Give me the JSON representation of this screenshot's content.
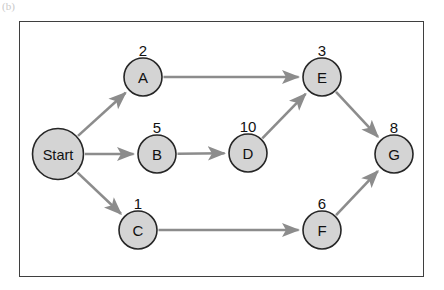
{
  "figure": {
    "corner_mark": "(b)",
    "frame": {
      "x": 19,
      "y": 21,
      "width": 405,
      "height": 256,
      "border_color": "#3f3f3f"
    }
  },
  "colors": {
    "node_fill": "#d4d4d4",
    "node_stroke": "#262626",
    "edge": "#8c8c8c",
    "text": "#111111",
    "background": "#ffffff"
  },
  "chart_data": {
    "type": "diagram",
    "title": "",
    "layout": "directed acyclic task graph, left to right",
    "nodes": [
      {
        "id": "Start",
        "label": "Start",
        "weight": null,
        "cx": 58,
        "cy": 154,
        "r": 25.5
      },
      {
        "id": "A",
        "label": "A",
        "weight": 2,
        "cx": 143,
        "cy": 77,
        "r": 19
      },
      {
        "id": "B",
        "label": "B",
        "weight": 5,
        "cx": 157,
        "cy": 154,
        "r": 19
      },
      {
        "id": "C",
        "label": "C",
        "weight": 1,
        "cx": 138,
        "cy": 230,
        "r": 19
      },
      {
        "id": "D",
        "label": "D",
        "weight": 10,
        "cx": 248,
        "cy": 153,
        "r": 19
      },
      {
        "id": "E",
        "label": "E",
        "weight": 3,
        "cx": 322,
        "cy": 77,
        "r": 19
      },
      {
        "id": "F",
        "label": "F",
        "weight": 6,
        "cx": 322,
        "cy": 230,
        "r": 19
      },
      {
        "id": "G",
        "label": "G",
        "weight": 8,
        "cx": 394,
        "cy": 154,
        "r": 19
      }
    ],
    "edges": [
      {
        "from": "Start",
        "to": "A"
      },
      {
        "from": "Start",
        "to": "B"
      },
      {
        "from": "Start",
        "to": "C"
      },
      {
        "from": "A",
        "to": "E"
      },
      {
        "from": "B",
        "to": "D"
      },
      {
        "from": "D",
        "to": "E"
      },
      {
        "from": "C",
        "to": "F"
      },
      {
        "from": "E",
        "to": "G"
      },
      {
        "from": "F",
        "to": "G"
      }
    ]
  }
}
